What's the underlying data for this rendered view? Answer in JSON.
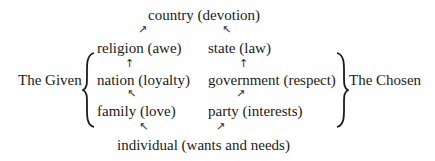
{
  "diagram": {
    "top": "country (devotion)",
    "left_column": [
      "religion (awe)",
      "nation (loyalty)",
      "family (love)"
    ],
    "right_column": [
      "state (law)",
      "government (respect)",
      "party (interests)"
    ],
    "bottom": "individual (wants and needs)",
    "left_label": "The Given",
    "right_label": "The Chosen",
    "arrows": {
      "up_right": "↗",
      "up_left": "↖",
      "up": "↑"
    }
  }
}
